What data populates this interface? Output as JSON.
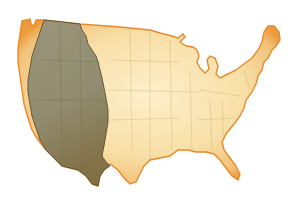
{
  "map": {
    "subject": "United States outline",
    "style": "aged parchment watercolor",
    "regions": [
      {
        "name": "western-region",
        "fill": "#8d8a6f",
        "edge": "#5e5332"
      },
      {
        "name": "eastern-region",
        "fill": "#f6dca0",
        "edge": "#e98c2a"
      }
    ],
    "colors": {
      "background": "#ffffff",
      "parchment_light": "#fbecc2",
      "parchment_mid": "#f4cf85",
      "parchment_edge": "#ec9a3a",
      "shaded_region": "#8f8c72",
      "shaded_dark": "#6a6446",
      "state_lines": "#c9a86a"
    }
  }
}
